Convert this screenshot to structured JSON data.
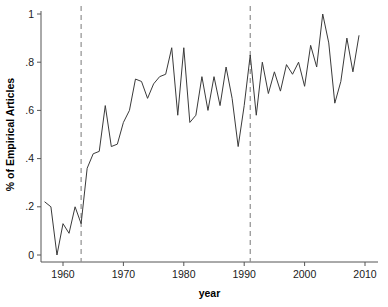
{
  "chart_data": {
    "type": "line",
    "title": "",
    "xlabel": "year",
    "ylabel": "% of Empirical Articles",
    "xlim": [
      1956.5,
      2010.5
    ],
    "ylim": [
      0,
      1
    ],
    "grid": false,
    "legend": "none",
    "xticks": [
      1960,
      1970,
      1980,
      1990,
      2000,
      2010
    ],
    "xtick_labels": [
      "1960",
      "1970",
      "1980",
      "1990",
      "2000",
      "2010"
    ],
    "yticks": [
      0,
      0.2,
      0.4,
      0.6,
      0.8,
      1
    ],
    "ytick_labels": [
      "0",
      ".2",
      ".4",
      ".6",
      ".8",
      "1"
    ],
    "line_color": "#3a3a3a",
    "reference_line_color": "#8f8f8f",
    "reference_lines": [
      {
        "x": 1963,
        "style": "dashed",
        "label": ""
      },
      {
        "x": 1991,
        "style": "dashed",
        "label": ""
      }
    ],
    "series": [
      {
        "name": "% of Empirical Articles",
        "x": [
          1957,
          1958,
          1959,
          1960,
          1961,
          1962,
          1963,
          1964,
          1965,
          1966,
          1967,
          1968,
          1969,
          1970,
          1971,
          1972,
          1973,
          1974,
          1975,
          1976,
          1977,
          1978,
          1979,
          1980,
          1981,
          1982,
          1983,
          1984,
          1985,
          1986,
          1987,
          1988,
          1989,
          1990,
          1991,
          1992,
          1993,
          1994,
          1995,
          1996,
          1997,
          1998,
          1999,
          2000,
          2001,
          2002,
          2003,
          2004,
          2005,
          2006,
          2007,
          2008,
          2009
        ],
        "values": [
          0.22,
          0.2,
          0.0,
          0.13,
          0.09,
          0.2,
          0.13,
          0.36,
          0.42,
          0.43,
          0.62,
          0.45,
          0.46,
          0.55,
          0.6,
          0.73,
          0.72,
          0.65,
          0.71,
          0.74,
          0.75,
          0.86,
          0.58,
          0.86,
          0.55,
          0.58,
          0.74,
          0.6,
          0.74,
          0.62,
          0.78,
          0.65,
          0.45,
          0.62,
          0.83,
          0.58,
          0.8,
          0.67,
          0.76,
          0.68,
          0.79,
          0.75,
          0.8,
          0.7,
          0.87,
          0.78,
          1.0,
          0.88,
          0.63,
          0.72,
          0.9,
          0.76,
          0.91
        ]
      }
    ]
  }
}
